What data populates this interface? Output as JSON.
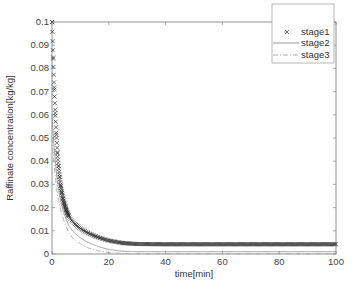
{
  "chart_data": {
    "type": "line",
    "title": "",
    "xlabel": "time[min]",
    "ylabel": "Raffinate concentration[kg/kg]",
    "xlim": [
      0,
      100
    ],
    "ylim": [
      0,
      0.1
    ],
    "xticks": [
      0,
      20,
      40,
      60,
      80,
      100
    ],
    "xtick_labels": [
      "0",
      "20",
      "40",
      "60",
      "80",
      "100"
    ],
    "yticks": [
      0,
      0.01,
      0.02,
      0.03,
      0.04,
      0.05,
      0.06,
      0.07,
      0.08,
      0.09,
      0.1
    ],
    "ytick_labels": [
      "0",
      "0.01",
      "0.02",
      "0.03",
      "0.04",
      "0.05",
      "0.06",
      "0.07",
      "0.08",
      "0.09",
      "0.1"
    ],
    "grid": false,
    "legend_position": "upper right",
    "series": [
      {
        "name": "stage1",
        "style": "x-markers",
        "color": "#333333",
        "x": [
          0,
          1,
          2,
          3,
          4,
          5,
          6,
          8,
          10,
          12,
          15,
          18,
          20,
          25,
          30,
          40,
          50,
          60,
          70,
          80,
          90,
          100
        ],
        "values": [
          0.1,
          0.065,
          0.042,
          0.03,
          0.023,
          0.019,
          0.016,
          0.013,
          0.011,
          0.0095,
          0.0078,
          0.0065,
          0.0058,
          0.0047,
          0.0043,
          0.0042,
          0.0042,
          0.0042,
          0.0042,
          0.0042,
          0.0042,
          0.0042
        ]
      },
      {
        "name": "stage2",
        "style": "solid",
        "color": "#999999",
        "x": [
          0,
          2,
          4,
          5,
          6,
          8,
          10,
          12,
          15,
          18,
          20,
          25,
          30,
          40,
          60,
          80,
          100
        ],
        "values": [
          0.06,
          0.03,
          0.018,
          0.015,
          0.012,
          0.009,
          0.007,
          0.0055,
          0.0038,
          0.0026,
          0.002,
          0.0012,
          0.001,
          0.001,
          0.001,
          0.001,
          0.001
        ]
      },
      {
        "name": "stage3",
        "style": "dash-dot",
        "color": "#aaaaaa",
        "x": [
          0,
          2,
          4,
          5,
          6,
          8,
          10,
          12,
          15,
          18,
          20,
          25,
          30,
          40,
          60,
          80,
          100
        ],
        "values": [
          0.05,
          0.025,
          0.015,
          0.012,
          0.009,
          0.006,
          0.0045,
          0.003,
          0.0018,
          0.001,
          0.0006,
          0.0003,
          0.0002,
          0.0002,
          0.0002,
          0.0002,
          0.0002
        ]
      }
    ]
  }
}
